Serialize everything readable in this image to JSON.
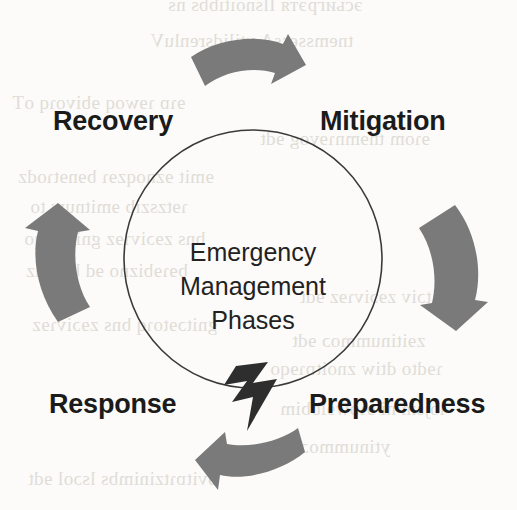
{
  "diagram": {
    "title": "Emergency Management Phases",
    "center_lines": [
      "Emergency",
      "Management",
      "Phases"
    ],
    "colors": {
      "arrow_fill": "#7a7a7a",
      "circle_stroke": "#3a3a3a",
      "label_text": "#1b1b1b",
      "center_text": "#222222",
      "bolt_fill": "#2e2e2e",
      "background": "#fcfbf9"
    },
    "phases": [
      {
        "id": "mitigation",
        "label": "Mitigation",
        "position": "top-right"
      },
      {
        "id": "preparedness",
        "label": "Preparedness",
        "position": "bottom-right"
      },
      {
        "id": "response",
        "label": "Response",
        "position": "bottom-left"
      },
      {
        "id": "recovery",
        "label": "Recovery",
        "position": "top-left"
      }
    ],
    "arrows": [
      {
        "id": "arrow-top",
        "direction": "right",
        "from": "recovery",
        "to": "mitigation"
      },
      {
        "id": "arrow-right",
        "direction": "down",
        "from": "mitigation",
        "to": "preparedness"
      },
      {
        "id": "arrow-bottom",
        "direction": "left",
        "from": "preparedness",
        "to": "response"
      },
      {
        "id": "arrow-left",
        "direction": "up",
        "from": "response",
        "to": "recovery"
      }
    ],
    "icons": [
      {
        "id": "lightning-bolt-icon",
        "position": "bottom-center"
      }
    ]
  },
  "background_bleed": [
    {
      "text": "эсьигрэтя Ilsnoitibbs ns",
      "x": 168,
      "y": -6
    },
    {
      "text": "tnemssessA ytilidsrenluV",
      "x": 150,
      "y": 30
    },
    {
      "text": "ɘɿɒ ɿɘwoq ɘbivoɿq oT",
      "x": 12,
      "y": 92
    },
    {
      "text": "ɘɿom tnɘmnɿɘvog ɘdt",
      "x": 260,
      "y": 128
    },
    {
      "text": "ɘmit ɘznoqzɘɿ bɘnɘtɿodz",
      "x": 18,
      "y": 166
    },
    {
      "text": "ɿɘtzszib ɘmitnuw to",
      "x": 30,
      "y": 196
    },
    {
      "text": "bns zɘɔivɿɘz gnitɒɿɘqo",
      "x": 24,
      "y": 228
    },
    {
      "text": "bɘɿɘbizno ɘd bluodz",
      "x": 26,
      "y": 260
    },
    {
      "text": "zmitɔiv zɘɔivɿɘz ɘdt",
      "x": 300,
      "y": 286
    },
    {
      "text": "gnitɔɘtoɿq bns zɘɔivɿɘz",
      "x": 32,
      "y": 314
    },
    {
      "text": "zɘitinummoɔ ɘdt",
      "x": 292,
      "y": 330
    },
    {
      "text": "ɿɘdto dtiw znoitɒɿɘqo",
      "x": 270,
      "y": 358
    },
    {
      "text": "ɿojsm ni ɘɿɒwɘlbbim",
      "x": 280,
      "y": 398
    },
    {
      "text": "ytinummoɔ",
      "x": 300,
      "y": 436
    },
    {
      "text": "ɘvitɒɿtzinimbs lsɔol ɘdt",
      "x": 28,
      "y": 468
    }
  ]
}
